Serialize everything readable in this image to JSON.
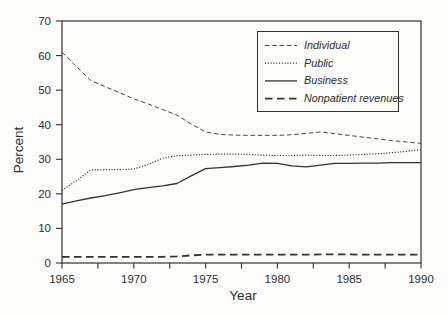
{
  "figure": {
    "background": "#fcfcfa",
    "ink_color": "#333333"
  },
  "chart_data": {
    "type": "line",
    "title": "",
    "xlabel": "Year",
    "ylabel": "Percent",
    "xlim": [
      1965,
      1990
    ],
    "ylim": [
      0,
      70
    ],
    "grid": false,
    "legend_position": "top-right",
    "x_major_ticks": [
      1965,
      1970,
      1975,
      1980,
      1985,
      1990
    ],
    "x_minor_tick_interval": 2.5,
    "y_ticks": [
      0,
      10,
      20,
      30,
      40,
      50,
      60,
      70
    ],
    "x": [
      1965,
      1966,
      1967,
      1968,
      1969,
      1970,
      1971,
      1972,
      1973,
      1974,
      1975,
      1976,
      1977,
      1978,
      1979,
      1980,
      1981,
      1982,
      1983,
      1984,
      1985,
      1986,
      1987,
      1988,
      1989,
      1990
    ],
    "series": [
      {
        "name": "Individual",
        "line_style": "dashed",
        "values": [
          61,
          56.8,
          52.8,
          51,
          49.3,
          47.5,
          46,
          44.4,
          42.8,
          40.2,
          37.9,
          37.2,
          37,
          36.9,
          36.9,
          36.9,
          37.1,
          37.5,
          37.9,
          37.4,
          36.9,
          36.4,
          35.9,
          35.4,
          35,
          34.6
        ]
      },
      {
        "name": "Public",
        "line_style": "dotted",
        "values": [
          21,
          23.8,
          26.9,
          27,
          27,
          27.2,
          28.5,
          30.3,
          31,
          31.2,
          31.4,
          31.5,
          31.5,
          31.4,
          31.2,
          31.1,
          31.1,
          31.2,
          31.1,
          31.1,
          31.2,
          31.4,
          31.6,
          31.9,
          32.3,
          32.8
        ]
      },
      {
        "name": "Business",
        "line_style": "solid",
        "values": [
          17,
          18,
          18.8,
          19.5,
          20.3,
          21.2,
          21.8,
          22.3,
          23,
          25.2,
          27.3,
          27.6,
          27.9,
          28.3,
          28.9,
          28.8,
          28.1,
          27.8,
          28.3,
          28.8,
          28.8,
          28.9,
          28.9,
          29,
          29,
          29
        ]
      },
      {
        "name": "Nonpatient revenues",
        "line_style": "bold-dashed",
        "values": [
          1.8,
          1.8,
          1.8,
          1.8,
          1.8,
          1.8,
          1.8,
          1.8,
          1.9,
          2.2,
          2.4,
          2.4,
          2.4,
          2.4,
          2.4,
          2.4,
          2.4,
          2.4,
          2.5,
          2.5,
          2.5,
          2.4,
          2.4,
          2.4,
          2.4,
          2.4
        ]
      }
    ]
  }
}
